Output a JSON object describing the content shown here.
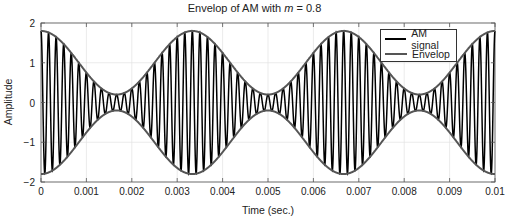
{
  "chart_data": {
    "type": "line",
    "title": "Envelop of AM with m = 0.8",
    "title_parts": {
      "prefix": "Envelop of AM with ",
      "var": "m",
      "suffix": " = 0.8"
    },
    "xlabel": "Time (sec.)",
    "ylabel": "Amplitude",
    "xlim": [
      0,
      0.01
    ],
    "ylim": [
      -2,
      2
    ],
    "xticks": [
      "0",
      "0.001",
      "0.002",
      "0.003",
      "0.004",
      "0.005",
      "0.006",
      "0.007",
      "0.008",
      "0.009",
      "0.01"
    ],
    "yticks": [
      "-2",
      "-1",
      "0",
      "1",
      "2"
    ],
    "grid": true,
    "legend_position": "upper right",
    "modulation_index": 0.8,
    "series": [
      {
        "name": "AM signal",
        "color": "#000000",
        "expr": "(1 + 0.8*cos(2*pi*300*t)) * cos(2*pi*6000*t)",
        "carrier_hz": 6000,
        "message_hz": 300
      },
      {
        "name": "Envelop",
        "color": "#555555",
        "expr": "±(1 + 0.8*cos(2*pi*300*t))",
        "max": 1.8,
        "min": 0.2
      }
    ]
  }
}
